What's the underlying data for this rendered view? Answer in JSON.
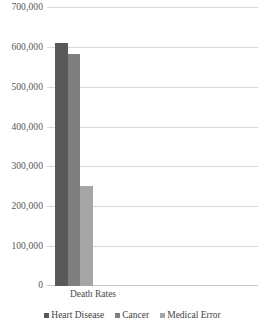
{
  "chart_data": {
    "type": "bar",
    "title": "",
    "subtitle": "",
    "xlabel": "",
    "ylabel": "",
    "categories": [
      "Death Rates"
    ],
    "series": [
      {
        "name": "Heart Disease",
        "values": [
          611000
        ],
        "color": "#595959"
      },
      {
        "name": "Cancer",
        "values": [
          585000
        ],
        "color": "#7f7f7f"
      },
      {
        "name": "Medical Error",
        "values": [
          251000
        ],
        "color": "#a6a6a6"
      }
    ],
    "ylim": [
      0,
      700000
    ],
    "ytick_step": 100000,
    "ytick_labels": [
      "0",
      "100,000",
      "200,000",
      "300,000",
      "400,000",
      "500,000",
      "600,000",
      "700,000"
    ],
    "ytick_values": [
      0,
      100000,
      200000,
      300000,
      400000,
      500000,
      600000,
      700000
    ],
    "grid": true,
    "gridline_color": "#d9d9d9",
    "legend_position": "bottom",
    "background_color": "#ffffff"
  }
}
